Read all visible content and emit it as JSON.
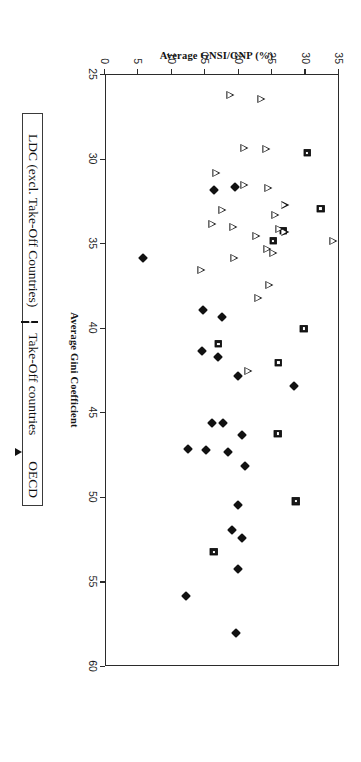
{
  "chart_data": {
    "type": "scatter",
    "title": "",
    "xlabel": "Average Gini Coefficient",
    "ylabel": "Average GNSI/GNP (%)",
    "xlim": [
      25,
      60
    ],
    "ylim": [
      0,
      35
    ],
    "xticks": [
      25,
      30,
      35,
      40,
      45,
      50,
      55,
      60
    ],
    "yticks": [
      0,
      5,
      10,
      15,
      20,
      25,
      30,
      35
    ],
    "grid": false,
    "legend_position": "below-axes",
    "orientation_note": "page-rotated-90-clockwise",
    "series": [
      {
        "name": "LDC (excl. Take-Off Countries)",
        "marker": "filled-diamond",
        "color": "#111111",
        "points": [
          [
            58.0,
            19.8
          ],
          [
            55.8,
            12.2
          ],
          [
            54.2,
            20.0
          ],
          [
            52.4,
            20.6
          ],
          [
            51.9,
            19.2
          ],
          [
            50.4,
            20.0
          ],
          [
            48.1,
            21.1
          ],
          [
            47.3,
            18.6
          ],
          [
            47.2,
            15.2
          ],
          [
            47.1,
            12.6
          ],
          [
            46.3,
            20.7
          ],
          [
            45.6,
            17.8
          ],
          [
            45.6,
            16.2
          ],
          [
            43.4,
            28.4
          ],
          [
            42.8,
            20.0
          ],
          [
            41.7,
            17.0
          ],
          [
            41.3,
            14.6
          ],
          [
            39.3,
            17.7
          ],
          [
            38.9,
            14.8
          ],
          [
            35.8,
            5.9
          ],
          [
            31.8,
            16.4
          ],
          [
            31.6,
            19.6
          ]
        ]
      },
      {
        "name": "Take-Off countries",
        "marker": "square",
        "color": "#1a1a1a",
        "points": [
          [
            53.2,
            16.4
          ],
          [
            50.2,
            28.7
          ],
          [
            46.2,
            26.0
          ],
          [
            42.0,
            26.1
          ],
          [
            40.9,
            17.1
          ],
          [
            40.0,
            29.9
          ],
          [
            34.8,
            25.3
          ],
          [
            34.2,
            26.8
          ],
          [
            32.9,
            32.4
          ],
          [
            29.6,
            30.4
          ]
        ]
      },
      {
        "name": "OECD",
        "marker": "triangle",
        "color": "#111111",
        "points": [
          [
            42.5,
            21.5
          ],
          [
            38.2,
            23.0
          ],
          [
            37.4,
            24.7
          ],
          [
            36.5,
            14.5
          ],
          [
            35.8,
            19.4
          ],
          [
            35.5,
            25.3
          ],
          [
            35.3,
            24.4
          ],
          [
            34.8,
            34.2
          ],
          [
            34.5,
            22.7
          ],
          [
            34.3,
            27.0
          ],
          [
            34.1,
            26.2
          ],
          [
            34.0,
            19.3
          ],
          [
            33.8,
            16.1
          ],
          [
            33.3,
            25.6
          ],
          [
            33.0,
            17.7
          ],
          [
            32.7,
            27.0
          ],
          [
            31.7,
            24.5
          ],
          [
            31.5,
            21.0
          ],
          [
            30.8,
            16.7
          ],
          [
            29.4,
            24.2
          ],
          [
            29.3,
            21.0
          ],
          [
            26.4,
            23.5
          ],
          [
            26.2,
            18.8
          ]
        ]
      }
    ]
  },
  "axes": {
    "x_title": "Average Gini Coefficient",
    "y_title": "Average GNSI/GNP (%)",
    "x_tick_labels": [
      "25",
      "30",
      "35",
      "40",
      "45",
      "50",
      "55",
      "60"
    ],
    "y_tick_labels": [
      "0",
      "5",
      "10",
      "15",
      "20",
      "25",
      "30",
      "35"
    ]
  },
  "legend": {
    "entries": [
      {
        "label": "LDC (excl. Take-Off Countries)",
        "marker": "diamond"
      },
      {
        "label": "Take-Off countries",
        "marker": "square"
      },
      {
        "label": "OECD",
        "marker": "triangle"
      }
    ]
  }
}
